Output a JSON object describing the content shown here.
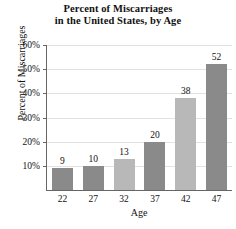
{
  "chart_data": {
    "type": "bar",
    "title": "Percent of Miscarriages in the United States, by Age",
    "title_lines": [
      "Percent of Miscarriages",
      "in the United States, by Age"
    ],
    "xlabel": "Age",
    "ylabel": "Percent of Miscarriages",
    "categories": [
      "22",
      "27",
      "32",
      "37",
      "42",
      "47"
    ],
    "values": [
      9,
      10,
      13,
      20,
      38,
      52
    ],
    "value_labels": [
      "9",
      "10",
      "13",
      "20",
      "38",
      "52"
    ],
    "bar_colors": [
      "#8a8a8a",
      "#8a8a8a",
      "#b8b8b8",
      "#8a8a8a",
      "#b8b8b8",
      "#8a8a8a"
    ],
    "ylim": [
      0,
      60
    ],
    "yticks": [
      10,
      20,
      30,
      40,
      50,
      60
    ],
    "ytick_labels": [
      "10%",
      "20%",
      "30%",
      "40%",
      "50%",
      "60%"
    ],
    "grid": true,
    "legend": null,
    "colors": {
      "bar_dark": "#8a8a8a",
      "bar_light": "#b8b8b8",
      "axis": "#666666",
      "grid": "#e2e2e2",
      "text": "#111111",
      "background": "#ffffff"
    }
  }
}
